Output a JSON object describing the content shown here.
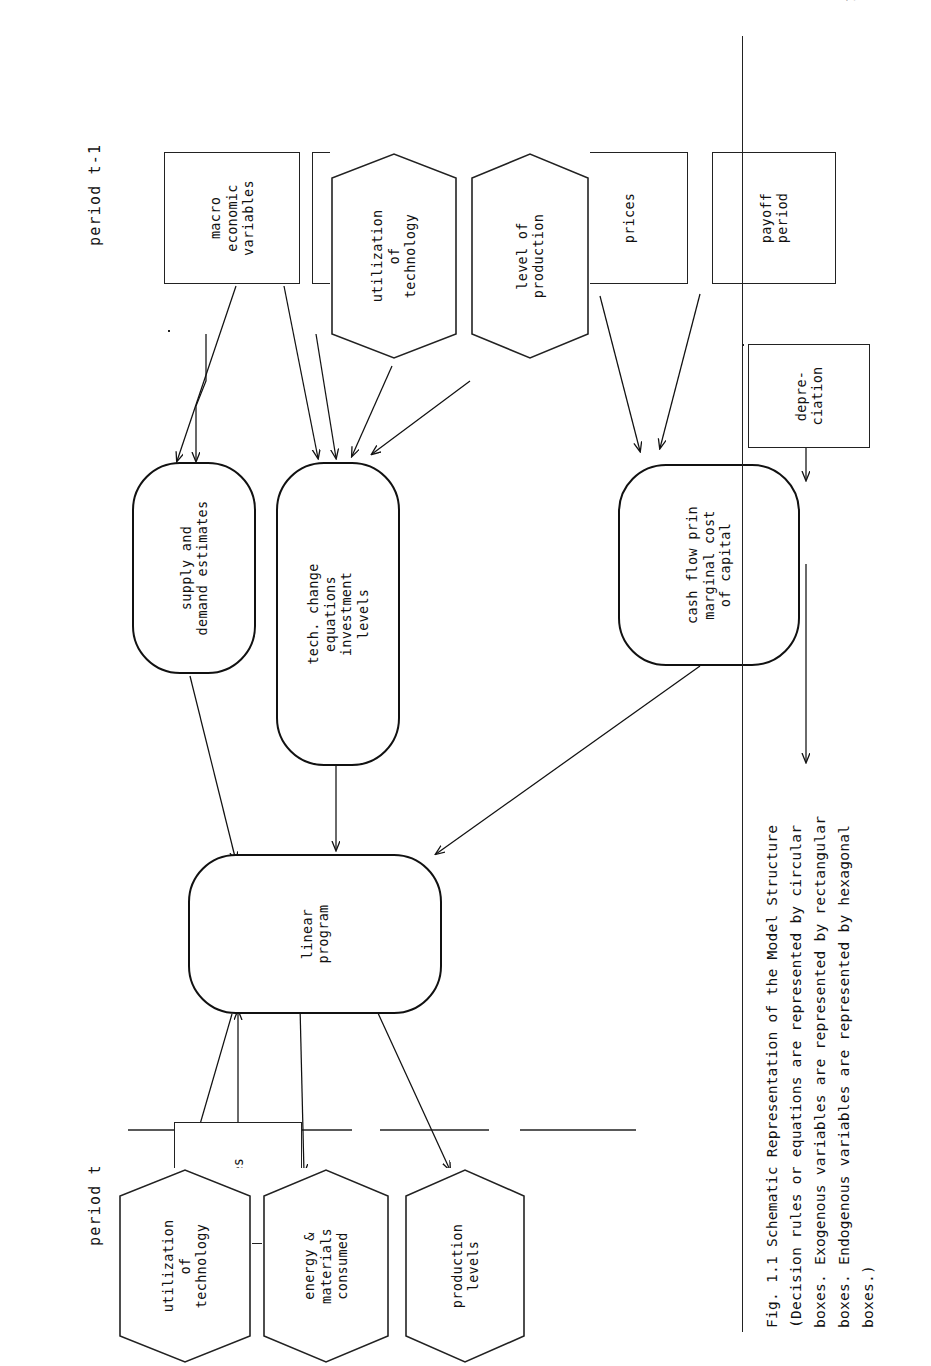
{
  "page": {
    "number": "10"
  },
  "figure": {
    "period_left_label": "period t-1",
    "period_right_label": "period t",
    "caption": "Fig. 1.1  Schematic Representation of the Model Structure\n(Decision rules or equations are represented by circular\nboxes. Exogenous variables are represented by rectangular\nboxes. Endogenous variables are represented by hexagonal\nboxes.)",
    "legend": {
      "decision_rules_shape": "circular",
      "exogenous_shape": "rectangular",
      "endogenous_shape": "hexagonal"
    },
    "nodes": {
      "supply_demand": "supply and\ndemand estimates",
      "tech_change": "tech. change\nequations\ninvestment\nlevels",
      "cash_flow": "cash flow prin\nmarginal cost\nof capital",
      "linear_program": "linear\nprogram",
      "macro_economic_variables": "macro\neconomic\nvariables",
      "prices_left": "prices",
      "utilization_of_technology_in": "utilization\nof\ntechnology",
      "level_of_production": "level of\nproduction",
      "prices_mid": "prices",
      "payoff_period": "payoff\nperiod",
      "depreciation": "depre-\nciation",
      "prices_right": "prices",
      "utilization_of_technology_out": "utilization\nof\ntechnology",
      "energy_materials_consumed": "energy &\nmaterials\nconsumed",
      "production_levels": "production\nlevels"
    },
    "colors": {
      "ink": "#111111",
      "paper": "#ffffff",
      "rule": "#222222"
    }
  }
}
